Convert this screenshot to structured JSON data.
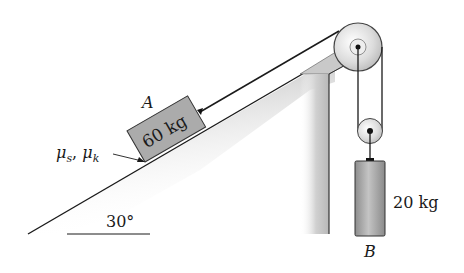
{
  "diagram": {
    "type": "pulley-incline-system",
    "incline": {
      "angle_label": "30°",
      "friction_label_main": "μ",
      "friction_sub_s": "s",
      "friction_sep": ", ",
      "friction_sub_k": "k"
    },
    "block_a": {
      "label": "A",
      "mass_label": "60 kg"
    },
    "block_b": {
      "label": "B",
      "mass_label": "20 kg"
    },
    "colors": {
      "line": "#1a1a1a",
      "block_fill": "#a9a9a9",
      "pulley_fill": "#e6e6e6",
      "support_fill": "#c8c8c8"
    }
  }
}
